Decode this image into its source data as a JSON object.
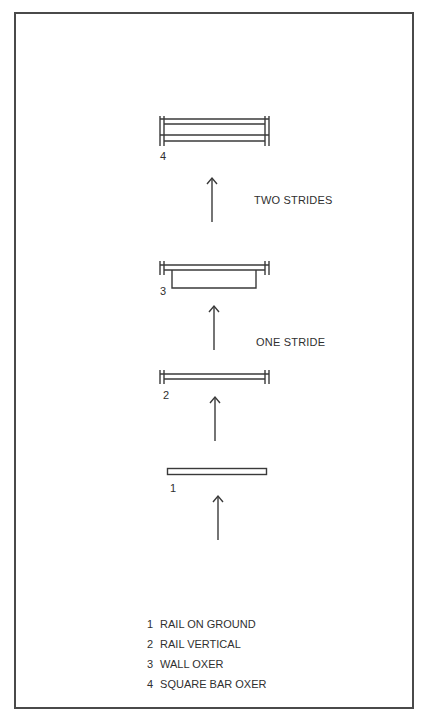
{
  "diagram": {
    "title": "",
    "stride_labels": {
      "between_3_and_4": "TWO STRIDES",
      "between_2_and_3": "ONE STRIDE"
    },
    "fences": [
      {
        "number": "1",
        "name": "RAIL ON GROUND"
      },
      {
        "number": "2",
        "name": "RAIL VERTICAL"
      },
      {
        "number": "3",
        "name": "WALL OXER"
      },
      {
        "number": "4",
        "name": "SQUARE BAR OXER"
      }
    ],
    "legend": [
      {
        "number": "1",
        "label": "RAIL ON GROUND"
      },
      {
        "number": "2",
        "label": "RAIL VERTICAL"
      },
      {
        "number": "3",
        "label": "WALL OXER"
      },
      {
        "number": "4",
        "label": "SQUARE BAR OXER"
      }
    ],
    "colors": {
      "line": "#3a3a3a",
      "border": "#4a4a4a",
      "background": "#ffffff"
    }
  }
}
